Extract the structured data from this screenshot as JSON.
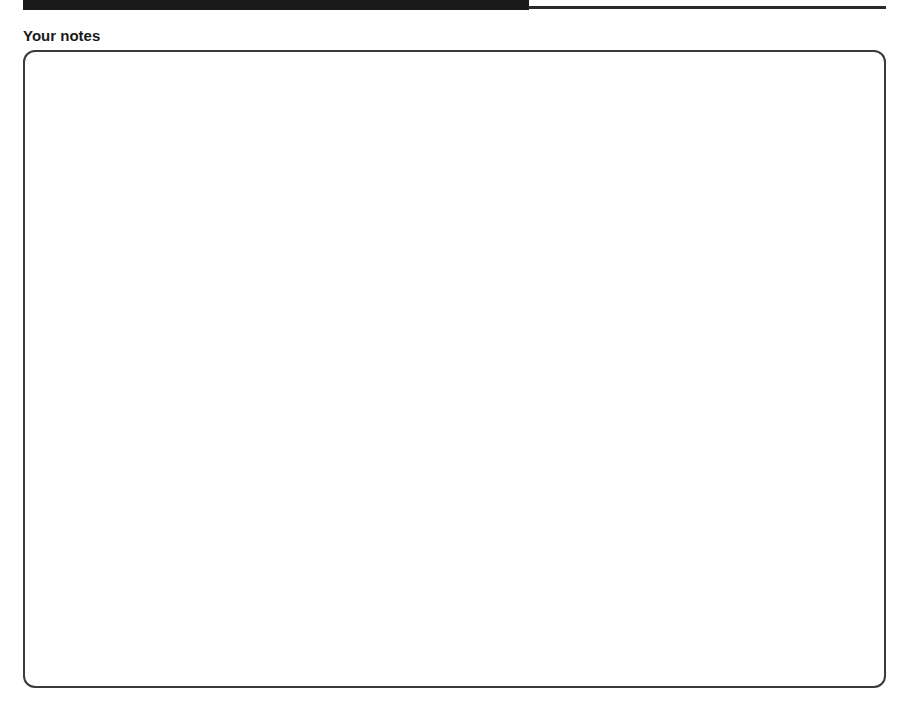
{
  "header_strip": {
    "bar_color": "#1a1a1a",
    "rule_color": "#2a2a2a"
  },
  "notes": {
    "heading": "Your notes",
    "content": ""
  }
}
